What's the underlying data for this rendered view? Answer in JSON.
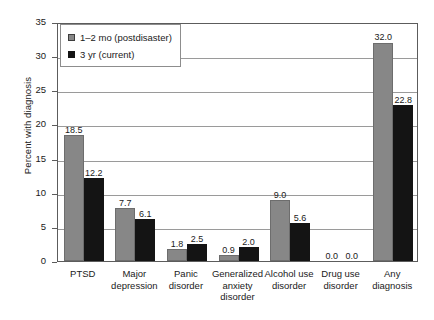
{
  "chart_data": {
    "type": "bar",
    "title": "",
    "xlabel": "",
    "ylabel": "Percent with diagnosis",
    "ylim": [
      0,
      35
    ],
    "yticks": [
      0,
      5,
      10,
      15,
      20,
      25,
      30,
      35
    ],
    "ytick_labels": [
      "0",
      "5",
      "10",
      "15",
      "20",
      "25",
      "30",
      "35"
    ],
    "grid": true,
    "legend_position": "upper left",
    "categories": [
      "PTSD",
      "Major\ndepression",
      "Panic\ndisorder",
      "Generalized\nanxiety\ndisorder",
      "Alcohol use\ndisorder",
      "Drug use\ndisorder",
      "Any\ndiagnosis"
    ],
    "series": [
      {
        "name": "1–2 mo (postdisaster)",
        "color": "#878787",
        "values": [
          18.5,
          7.7,
          1.8,
          0.9,
          9.0,
          0.0,
          32.0
        ],
        "labels": [
          "18.5",
          "7.7",
          "1.8",
          "0.9",
          "9.0",
          "0.0",
          "32.0"
        ]
      },
      {
        "name": "3 yr (current)",
        "color": "#141414",
        "values": [
          12.2,
          6.1,
          2.5,
          2.0,
          5.6,
          0.0,
          22.8
        ],
        "labels": [
          "12.2",
          "6.1",
          "2.5",
          "2.0",
          "5.6",
          "0.0",
          "22.8"
        ]
      }
    ]
  },
  "legend": {
    "items": [
      {
        "label": "1–2 mo (postdisaster)"
      },
      {
        "label": "3 yr (current)"
      }
    ]
  },
  "axes": {
    "y_title": "Percent with diagnosis"
  }
}
